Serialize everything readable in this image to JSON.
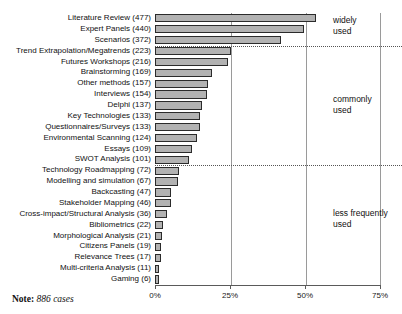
{
  "note": {
    "prefix": "Note:",
    "text": "886 cases"
  },
  "bands": [
    {
      "id": "widely-used",
      "line1": "widely",
      "line2": "used"
    },
    {
      "id": "commonly-used",
      "line1": "commonly",
      "line2": "used"
    },
    {
      "id": "less-frequently-used",
      "line1": "less frequently",
      "line2": "used"
    }
  ],
  "chart_data": {
    "type": "bar",
    "orientation": "horizontal",
    "title": "",
    "xlabel": "",
    "ylabel": "",
    "xlim": [
      0,
      75.3
    ],
    "xticks": [
      0,
      25,
      50,
      75
    ],
    "xtick_labels": [
      "0%",
      "25%",
      "50%",
      "75%"
    ],
    "grid": true,
    "grid_axis": "x",
    "legend": "none",
    "base_n": 886,
    "value_unit": "percent of cases",
    "categories": [
      "Literature Review (477)",
      "Expert Panels (440)",
      "Scenarios (372)",
      "Trend Extrapolation/Megatrends (223)",
      "Futures Workshops (216)",
      "Brainstorming (169)",
      "Other methods (157)",
      "Interviews (154)",
      "Delphi (137)",
      "Key Technologies (133)",
      "Questionnaires/Surveys (133)",
      "Environmental Scanning (124)",
      "Essays (109)",
      "SWOT Analysis (101)",
      "Technology Roadmapping (72)",
      "Modelling and simulation (67)",
      "Backcasting (47)",
      "Stakeholder Mapping (46)",
      "Cross-impact/Structural Analysis (36)",
      "Bibliometrics (22)",
      "Morphological Analysis (21)",
      "Citizens Panels (19)",
      "Relevance Trees (17)",
      "Multi-criteria Analysis (11)",
      "Gaming (6)"
    ],
    "counts": [
      477,
      440,
      372,
      223,
      216,
      169,
      157,
      154,
      137,
      133,
      133,
      124,
      109,
      101,
      72,
      67,
      47,
      46,
      36,
      22,
      21,
      19,
      17,
      11,
      6
    ],
    "values": [
      53.8,
      49.7,
      42.0,
      25.2,
      24.4,
      19.1,
      17.7,
      17.4,
      15.5,
      15.0,
      15.0,
      14.0,
      12.3,
      11.4,
      8.1,
      7.6,
      5.3,
      5.2,
      4.1,
      2.5,
      2.4,
      2.1,
      1.9,
      1.2,
      0.7
    ],
    "annotations": [
      {
        "text": "widely used",
        "after_category_index": 2
      },
      {
        "text": "commonly used",
        "after_category_index": 13
      },
      {
        "text": "less frequently used",
        "after_category_index": 24
      }
    ]
  }
}
